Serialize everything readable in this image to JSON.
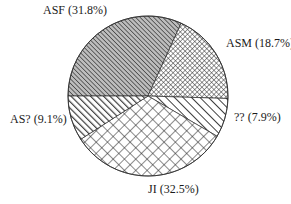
{
  "chart_data": {
    "type": "pie",
    "title": "",
    "slices": [
      {
        "label": "ASF",
        "value": 31.8,
        "display": "ASF (31.8%)",
        "pattern": "dense-diagonal-hatch"
      },
      {
        "label": "ASM",
        "value": 18.7,
        "display": "ASM (18.7%)",
        "pattern": "fine-crosshatch"
      },
      {
        "label": "??",
        "value": 7.9,
        "display": "?? (7.9%)",
        "pattern": "sparse-diagonal-hatch"
      },
      {
        "label": "JI",
        "value": 32.5,
        "display": "JI (32.5%)",
        "pattern": "diamond-crosshatch"
      },
      {
        "label": "AS?",
        "value": 9.1,
        "display": "AS? (9.1%)",
        "pattern": "bold-diagonal-hatch"
      }
    ],
    "labels_outside": true,
    "legend": "none",
    "colors": {
      "ink": "#1a1a1a",
      "background": "#ffffff"
    }
  },
  "labels": {
    "asf": "ASF (31.8%)",
    "asm": "ASM (18.7%)",
    "unknown": "?? (7.9%)",
    "ji": "JI (32.5%)",
    "as_unknown": "AS? (9.1%)"
  }
}
